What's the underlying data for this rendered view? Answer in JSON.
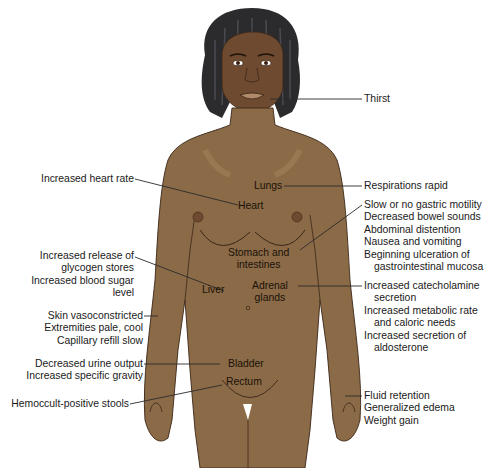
{
  "colors": {
    "skin": "#8b6a47",
    "skin_shade": "#7a5a3a",
    "skin_highlight": "#a5845f",
    "face": "#6e4a30",
    "hair": "#2b2b2e",
    "outline": "#3a2616",
    "leader_line": "#2a2a2a",
    "text": "#1a1a1a",
    "background": "#ffffff"
  },
  "organs": {
    "lungs": "Lungs",
    "heart": "Heart",
    "stomach": [
      "Stomach and",
      "intestines"
    ],
    "liver": "Liver",
    "adrenal": [
      "Adrenal",
      "glands"
    ],
    "bladder": "Bladder",
    "rectum": "Rectum"
  },
  "left_labels": {
    "heart": [
      "Increased heart rate"
    ],
    "liver": [
      "Increased release of",
      "glycogen stores",
      "Increased blood sugar",
      "level"
    ],
    "skin": [
      "Skin vasoconstricted",
      "Extremities pale, cool",
      "Capillary refill slow"
    ],
    "bladder": [
      "Decreased urine output",
      "Increased specific gravity"
    ],
    "rectum": [
      "Hemoccult-positive stools"
    ]
  },
  "right_labels": {
    "thirst": [
      "Thirst"
    ],
    "lungs": [
      "Respirations rapid"
    ],
    "gi": [
      "Slow or no gastric motility",
      "Decreased bowel sounds",
      "Abdominal distention",
      "Nausea and vomiting",
      "Beginning ulceration of",
      "gastrointestinal mucosa"
    ],
    "adrenal": [
      "Increased catecholamine",
      "secretion",
      "Increased metabolic rate",
      "and caloric needs",
      "Increased secretion of",
      "aldosterone"
    ],
    "fluid": [
      "Fluid retention",
      "Generalized edema",
      "Weight gain"
    ]
  }
}
